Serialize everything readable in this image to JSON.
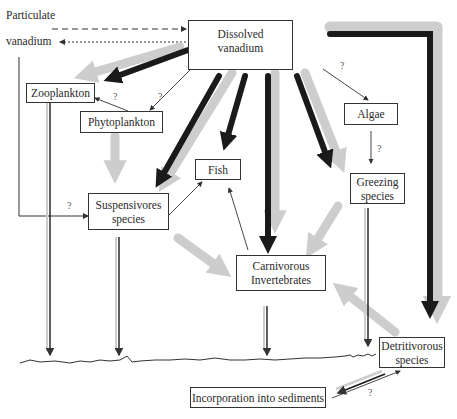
{
  "diagram": {
    "source_labels": {
      "particulate": "Particulate",
      "vanadium": "vanadium"
    },
    "nodes": {
      "dissolved": {
        "line1": "Dissolved",
        "line2": "vanadium"
      },
      "zooplankton": {
        "label": "Zooplankton"
      },
      "phytoplankton": {
        "label": "Phytoplankton"
      },
      "algae": {
        "label": "Algae"
      },
      "fish": {
        "label": "Fish"
      },
      "suspensivores": {
        "line1": "Suspensivores",
        "line2": "species"
      },
      "greezing": {
        "line1": "Greezing",
        "line2": "species"
      },
      "carnivorous": {
        "line1": "Carnivorous",
        "line2": "Invertebrates"
      },
      "detritivorous": {
        "line1": "Detritivorous",
        "line2": "species"
      },
      "sediments": {
        "label": "Incorporation into sediments"
      }
    },
    "uncertain_marks": [
      "?",
      "?",
      "?",
      "?",
      "?",
      "?"
    ],
    "legend_colors": {
      "black_arrow": "#1a1a1a",
      "grey_arrow": "#c8c8c8",
      "thin_line": "#333333"
    }
  }
}
